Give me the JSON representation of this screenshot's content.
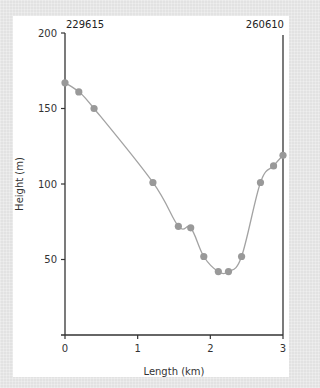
{
  "chart_data": {
    "type": "line",
    "title": "",
    "xlabel": "Length (km)",
    "ylabel": "Height (m)",
    "xlim": [
      0,
      3
    ],
    "ylim": [
      0,
      200
    ],
    "x_ticks": [
      0,
      1,
      2,
      3
    ],
    "y_ticks": [
      50,
      100,
      150,
      200
    ],
    "grid": false,
    "legend": null,
    "annotations": {
      "left_top": "229615",
      "right_top": "260610"
    },
    "series": [
      {
        "name": "Elevation profile",
        "color": "#999999",
        "line_color": "#a0a0a0",
        "smooth": true,
        "x": [
          0.0,
          0.19,
          0.4,
          1.21,
          1.56,
          1.73,
          1.91,
          2.11,
          2.25,
          2.43,
          2.69,
          2.87,
          3.0
        ],
        "y": [
          167,
          161,
          150,
          101,
          72,
          71,
          52,
          42,
          42,
          52,
          101,
          112,
          119
        ]
      }
    ]
  }
}
